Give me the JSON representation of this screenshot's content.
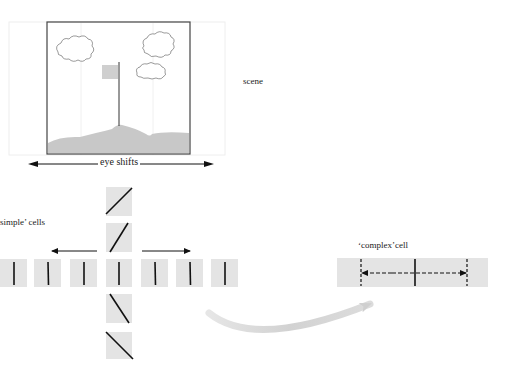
{
  "labels": {
    "scene": "scene",
    "eye_shifts": "eye shifts",
    "simple_cells": "simple’ cells",
    "complex_cell": "‘complex’cell"
  },
  "colors": {
    "cell_fill": "#e4e4e4",
    "ground_fill": "#c8c8c8",
    "flag_fill": "#cfcfcf",
    "frame_stroke": "#444444",
    "faint_grid": "#eeeeee",
    "line_stroke": "#111111",
    "curved_arrow": "#d6d6d6"
  },
  "simple_cells": {
    "horizontal_row": [
      {
        "x": 0,
        "orientation": "vertical"
      },
      {
        "x": 34,
        "orientation": "vertical"
      },
      {
        "x": 70,
        "orientation": "vertical"
      },
      {
        "x": 106,
        "orientation": "vertical"
      },
      {
        "x": 141,
        "orientation": "vertical"
      },
      {
        "x": 176,
        "orientation": "vertical"
      },
      {
        "x": 211,
        "orientation": "vertical"
      }
    ],
    "vertical_column": [
      {
        "y": 187,
        "orientation": "45deg-right"
      },
      {
        "y": 223,
        "orientation": "60deg-right"
      },
      {
        "y": 294,
        "orientation": "60deg-left"
      },
      {
        "y": 332,
        "orientation": "45deg-left"
      }
    ]
  },
  "complex_cell": {
    "dashed_lines": 2,
    "solid_lines": 1
  }
}
